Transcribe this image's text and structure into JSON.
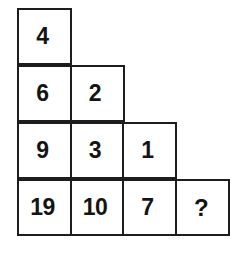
{
  "puzzle": {
    "title": "Number staircase puzzle",
    "shape": "staircase",
    "rows": [
      {
        "cells": [
          {
            "value": "4",
            "is_query": false
          }
        ]
      },
      {
        "cells": [
          {
            "value": "6",
            "is_query": false
          },
          {
            "value": "2",
            "is_query": false
          }
        ]
      },
      {
        "cells": [
          {
            "value": "9",
            "is_query": false
          },
          {
            "value": "3",
            "is_query": false
          },
          {
            "value": "1",
            "is_query": false
          }
        ]
      },
      {
        "cells": [
          {
            "value": "19",
            "is_query": false
          },
          {
            "value": "10",
            "is_query": false
          },
          {
            "value": "7",
            "is_query": false
          },
          {
            "value": "?",
            "is_query": true
          }
        ]
      }
    ],
    "colors": {
      "border": "#1d1d1d",
      "text": "#141414",
      "cell_background": "#ffffff",
      "page_background": "#ffffff"
    }
  },
  "chart_data": {
    "type": "table",
    "rows": [
      [
        "4"
      ],
      [
        "6",
        "2"
      ],
      [
        "9",
        "3",
        "1"
      ],
      [
        "19",
        "10",
        "7",
        "?"
      ]
    ],
    "missing_value_marker": "?",
    "grid": true,
    "legend": ""
  }
}
